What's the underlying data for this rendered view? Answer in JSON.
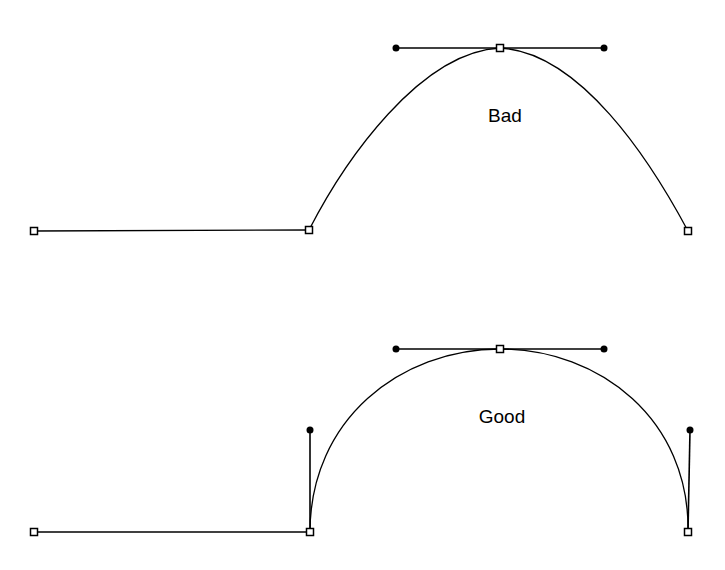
{
  "colors": {
    "stroke": "#000000",
    "background": "#ffffff",
    "anchor_fill": "#ffffff"
  },
  "diagrams": [
    {
      "name": "bad",
      "label": "Bad",
      "label_pos": [
        505,
        122
      ],
      "line": [
        [
          34,
          231
        ],
        [
          309,
          230
        ]
      ],
      "curve_path": "M309,230 C345,160 420,52 500,48 C580,52 650,160 688,231",
      "handle_lines": [
        [
          [
            396,
            48
          ],
          [
            604,
            48
          ]
        ]
      ],
      "anchors": [
        [
          34,
          231
        ],
        [
          309,
          230
        ],
        [
          500,
          48
        ],
        [
          688,
          231
        ]
      ],
      "handles": [
        [
          396,
          48
        ],
        [
          604,
          48
        ]
      ]
    },
    {
      "name": "good",
      "label": "Good",
      "label_pos": [
        502,
        423
      ],
      "line": [
        [
          34,
          532
        ],
        [
          310,
          532
        ]
      ],
      "curve_path": "M310,532 C310,420 400,349 500,349 C600,349 690,420 688,532",
      "handle_lines": [
        [
          [
            396,
            349
          ],
          [
            604,
            349
          ]
        ],
        [
          [
            310,
            430
          ],
          [
            310,
            532
          ]
        ],
        [
          [
            690,
            430
          ],
          [
            688,
            532
          ]
        ]
      ],
      "anchors": [
        [
          34,
          532
        ],
        [
          310,
          532
        ],
        [
          500,
          349
        ],
        [
          688,
          532
        ]
      ],
      "handles": [
        [
          396,
          349
        ],
        [
          604,
          349
        ],
        [
          310,
          430
        ],
        [
          690,
          430
        ]
      ]
    }
  ]
}
